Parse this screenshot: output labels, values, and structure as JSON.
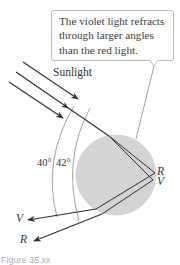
{
  "figure": {
    "callout": {
      "lines": [
        "The violet light refracts",
        "through larger angles",
        "than the red light."
      ]
    },
    "labels": {
      "sunlight": "Sunlight",
      "angle_outer": "40°",
      "angle_inner": "42°",
      "droplet_red": "R",
      "droplet_violet": "V",
      "exit_violet": "V",
      "exit_red": "R"
    },
    "caption": "Figure 35.xx",
    "colors": {
      "droplet_fill": "#d4d4d6",
      "droplet_stroke": "#c8c8ca",
      "ray": "#2e2e30",
      "arc": "#7a7a7c",
      "callout_border": "#b9b9bb",
      "text": "#333335"
    }
  }
}
